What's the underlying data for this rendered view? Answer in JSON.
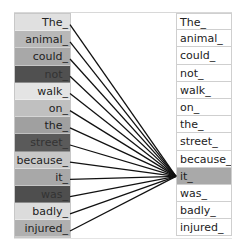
{
  "query_token_index": 9,
  "left_tokens": [
    {
      "label": "The_",
      "shade": "#e0e0e0",
      "text_color": "#222222"
    },
    {
      "label": "animal_",
      "shade": "#b8b8b8",
      "text_color": "#222222"
    },
    {
      "label": "could_",
      "shade": "#a8a8a8",
      "text_color": "#222222"
    },
    {
      "label": "not_",
      "shade": "#505050",
      "text_color": "#333333"
    },
    {
      "label": "walk_",
      "shade": "#e4e4e4",
      "text_color": "#222222"
    },
    {
      "label": "on_",
      "shade": "#c0c0c0",
      "text_color": "#222222"
    },
    {
      "label": "the_",
      "shade": "#a0a0a0",
      "text_color": "#222222"
    },
    {
      "label": "street_",
      "shade": "#5a5a5a",
      "text_color": "#333333"
    },
    {
      "label": "because_",
      "shade": "#c8c8c8",
      "text_color": "#222222"
    },
    {
      "label": "it_",
      "shade": "#a8a8a8",
      "text_color": "#222222"
    },
    {
      "label": "was_",
      "shade": "#4e4e4e",
      "text_color": "#333333"
    },
    {
      "label": "badly_",
      "shade": "#dcdcdc",
      "text_color": "#222222"
    },
    {
      "label": "injured_",
      "shade": "#b0b0b0",
      "text_color": "#222222"
    }
  ],
  "right_tokens": [
    {
      "label": "The_"
    },
    {
      "label": "animal_"
    },
    {
      "label": "could_"
    },
    {
      "label": "not_"
    },
    {
      "label": "walk_"
    },
    {
      "label": "on_"
    },
    {
      "label": "the_"
    },
    {
      "label": "street_"
    },
    {
      "label": "because_"
    },
    {
      "label": "it_"
    },
    {
      "label": "was_"
    },
    {
      "label": "badly_"
    },
    {
      "label": "injured_"
    }
  ],
  "colors": {
    "highlight": "#a9a9a9",
    "line": "#111111"
  }
}
